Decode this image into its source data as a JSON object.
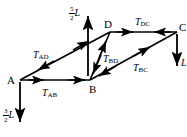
{
  "figure": {
    "type": "force-diagram",
    "nodes": [
      {
        "id": "A",
        "label": "A",
        "x": 20,
        "y": 80
      },
      {
        "id": "B",
        "label": "B",
        "x": 90,
        "y": 80
      },
      {
        "id": "D",
        "label": "D",
        "x": 110,
        "y": 32
      },
      {
        "id": "C",
        "label": "C",
        "x": 177,
        "y": 32
      }
    ],
    "members": [
      {
        "id": "AD",
        "label_base": "T",
        "label_sub": "AD",
        "from": "A",
        "to": "D",
        "arrows": "double-outward"
      },
      {
        "id": "AB",
        "label_base": "T",
        "label_sub": "AB",
        "from": "A",
        "to": "B",
        "arrows": "double-right"
      },
      {
        "id": "BD",
        "label_base": "T",
        "label_sub": "BD",
        "from": "B",
        "to": "D",
        "arrows": "double-outward"
      },
      {
        "id": "BC",
        "label_base": "T",
        "label_sub": "BC",
        "from": "B",
        "to": "C",
        "arrows": "double-outward"
      },
      {
        "id": "DC",
        "label_base": "T",
        "label_sub": "DC",
        "from": "D",
        "to": "C",
        "arrows": "double-inward"
      }
    ],
    "loads": [
      {
        "id": "load-at-B",
        "numerator": "5",
        "denominator": "2",
        "unit": "L",
        "direction": "up",
        "at": "B"
      },
      {
        "id": "load-at-A",
        "numerator": "3",
        "denominator": "2",
        "unit": "L",
        "direction": "down",
        "at": "A"
      },
      {
        "id": "load-at-C",
        "numerator": "",
        "denominator": "",
        "unit": "L",
        "direction": "down",
        "at": "C"
      }
    ],
    "colors": {
      "stroke": "#000000",
      "background": "#ffffff"
    }
  }
}
